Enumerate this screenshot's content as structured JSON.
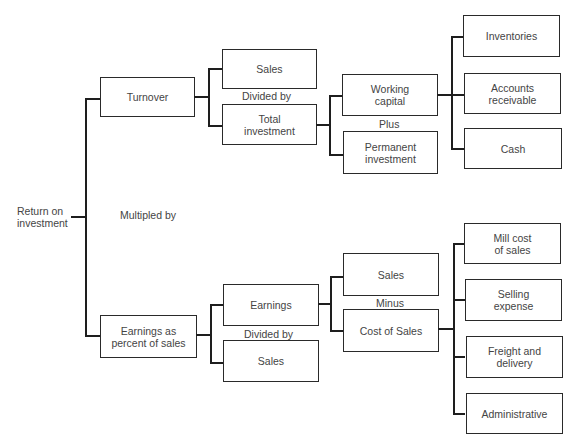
{
  "diagram": {
    "root": {
      "label": "Return on\ninvestment"
    },
    "operators": {
      "multiplied_by": "Multipled by",
      "turnover_divided_by": "Divided by",
      "working_capital_plus": "Plus",
      "earnings_minus": "Minus",
      "earnings_pct_divided_by": "Divided by"
    },
    "nodes": {
      "turnover": "Turnover",
      "sales_top": "Sales",
      "total_investment": "Total\ninvestment",
      "working_capital": "Working\ncapital",
      "permanent_investment": "Permanent\ninvestment",
      "inventories": "Inventories",
      "accounts_receivable": "Accounts\nreceivable",
      "cash": "Cash",
      "earnings_pct_sales": "Earnings  as\npercent of sales",
      "earnings": "Earnings",
      "sales_bottom": "Sales",
      "sales_minus": "Sales",
      "cost_of_sales": "Cost of Sales",
      "mill_cost_of_sales": "Mill cost\nof sales",
      "selling_expense": "Selling\nexpense",
      "freight_and_delivery": "Freight and\ndelivery",
      "administrative": "Administrative"
    }
  }
}
